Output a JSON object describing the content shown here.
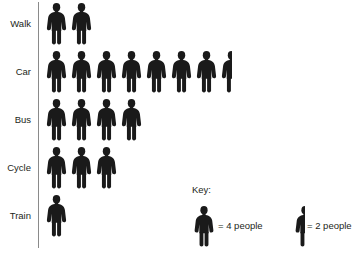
{
  "chart_data": {
    "type": "bar",
    "chart_style": "pictogram",
    "title": "",
    "xlabel": "",
    "ylabel": "",
    "categories": [
      "Walk",
      "Car",
      "Bus",
      "Cycle",
      "Train"
    ],
    "values": [
      8,
      30,
      16,
      12,
      4
    ],
    "icon_counts": [
      2,
      7.5,
      4,
      3,
      1
    ],
    "icon_unit_value": 4,
    "half_icon_value": 2,
    "icon_name": "person-icon",
    "icon_color": "#1a1a1a",
    "axis_color": "#8a8a8a",
    "grid": false,
    "legend_position": "bottom-right",
    "annotations": [],
    "rows": [
      {
        "label": "Walk",
        "full_icons": 2,
        "half_icon": false,
        "people": 8
      },
      {
        "label": "Car",
        "full_icons": 7,
        "half_icon": true,
        "people": 30
      },
      {
        "label": "Bus",
        "full_icons": 4,
        "half_icon": false,
        "people": 16
      },
      {
        "label": "Cycle",
        "full_icons": 3,
        "half_icon": false,
        "people": 12
      },
      {
        "label": "Train",
        "full_icons": 1,
        "half_icon": false,
        "people": 4
      }
    ]
  },
  "key": {
    "title": "Key:",
    "entries": [
      {
        "icon": "person-icon-full",
        "text": "= 4 people",
        "value": 4
      },
      {
        "icon": "person-icon-half",
        "text": "= 2 people",
        "value": 2
      }
    ]
  }
}
